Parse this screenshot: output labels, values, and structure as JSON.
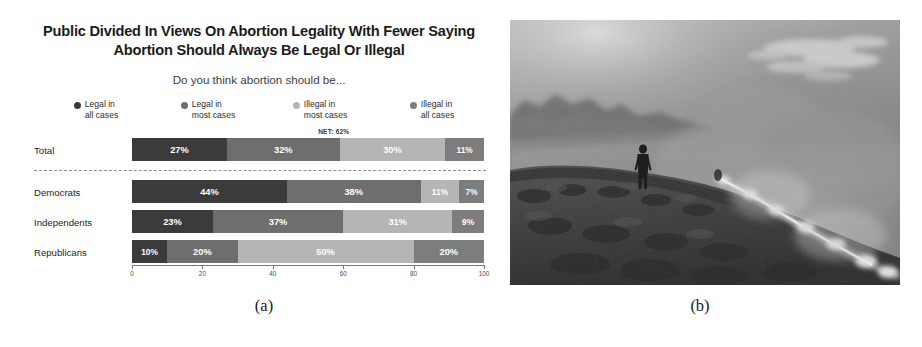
{
  "figure": {
    "subcaptions": [
      {
        "label": "(a)",
        "x": 264
      },
      {
        "label": "(b)",
        "x": 700
      }
    ]
  },
  "chart_data": {
    "type": "bar",
    "orientation": "horizontal",
    "stacked": true,
    "title": "Public Divided In Views On Abortion Legality With Fewer Saying Abortion Should Always Be Legal Or Illegal",
    "subtitle": "Do you think abortion should be...",
    "categories": [
      "Total",
      "Democrats",
      "Independents",
      "Republicans"
    ],
    "series": [
      {
        "name": "Legal in\nall cases",
        "color": "#3b3b3b",
        "values": [
          27,
          44,
          23,
          10
        ]
      },
      {
        "name": "Legal in\nmost cases",
        "color": "#6e6e6e",
        "values": [
          32,
          38,
          37,
          20
        ]
      },
      {
        "name": "Illegal in\nmost cases",
        "color": "#b5b5b5",
        "values": [
          30,
          11,
          31,
          50
        ]
      },
      {
        "name": "Illegal in\nall cases",
        "color": "#7d7d7d",
        "values": [
          11,
          7,
          9,
          20
        ]
      }
    ],
    "value_labels": [
      [
        "27%",
        "32%",
        "30%",
        "11%"
      ],
      [
        "44%",
        "38%",
        "11%",
        "7%"
      ],
      [
        "23%",
        "37%",
        "31%",
        "9%"
      ],
      [
        "10%",
        "20%",
        "50%",
        "20%"
      ]
    ],
    "annotations": [
      {
        "text": "NET: 62%",
        "row": "Total",
        "span_start": 27,
        "span_end": 89
      }
    ],
    "xlabel": "",
    "ylabel": "",
    "xlim": [
      0,
      100
    ],
    "xticks": [
      0,
      20,
      40,
      60,
      80,
      100
    ],
    "xtick_labels": [
      "0",
      "20",
      "40",
      "60",
      "80",
      "100"
    ],
    "grid": false,
    "legend_position": "top",
    "separator_after": "Total"
  },
  "photo": {
    "description": "grayscale photograph of a lone silhouetted figure standing on a smoky hillside ridge with a line of brush fire and heavy smoke",
    "tones": {
      "sky_light": "#b9b9b9",
      "sky_mid": "#8d8d8d",
      "smoke": "#9a9a9a",
      "ridge_dark": "#3a3a3a",
      "ground": "#4a4a4a",
      "fire_bright": "#e8e8e8",
      "figure": "#1c1c1c"
    }
  }
}
